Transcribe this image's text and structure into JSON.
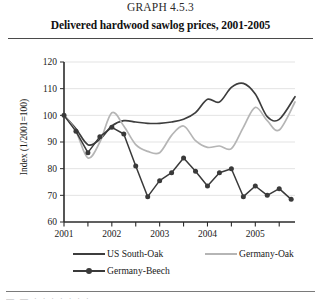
{
  "header": {
    "graph_number": "GRAPH 4.5.3",
    "title": "Delivered hardwood sawlog prices, 2001-2005"
  },
  "footer": {
    "clipped_text": "—  —   ·    ·     ·      · ·      · ·"
  },
  "colors": {
    "us_south_oak": "#3d3d3d",
    "germany_oak": "#b5b5b5",
    "germany_beech": "#3a3a3a",
    "grid": "#e3e3e3",
    "axis": "#2b2b2b",
    "text": "#1a1a1a"
  },
  "chart_data": {
    "type": "line",
    "title": "Delivered hardwood sawlog prices, 2001-2005",
    "subtitle": "GRAPH 4.5.3",
    "xlabel": "",
    "ylabel": "Index (1/2001=100)",
    "ylim": [
      60,
      120
    ],
    "yticks": [
      60,
      70,
      80,
      90,
      100,
      110,
      120
    ],
    "ytick_labels": [
      "60",
      "70",
      "80",
      "90",
      "100",
      "110",
      "120"
    ],
    "xlim": [
      2001.0,
      2005.83
    ],
    "xticks": [
      2001,
      2002,
      2003,
      2004,
      2005
    ],
    "xtick_labels": [
      "2001",
      "2002",
      "2003",
      "2004",
      "2005"
    ],
    "minor_xticks": [
      2001.5,
      2002.5,
      2003.5,
      2004.5,
      2005.5
    ],
    "grid": "horizontal",
    "legend_position": "below",
    "series": [
      {
        "name": "US South-Oak",
        "color": "#3d3d3d",
        "marker": "none",
        "x": [
          2001.0,
          2001.25,
          2001.5,
          2001.75,
          2002.0,
          2002.25,
          2002.5,
          2002.75,
          2003.0,
          2003.25,
          2003.5,
          2003.75,
          2004.0,
          2004.25,
          2004.5,
          2004.75,
          2005.0,
          2005.25,
          2005.5,
          2005.83
        ],
        "y": [
          100.0,
          95.0,
          89.0,
          91.0,
          96.0,
          98.0,
          97.5,
          97.0,
          97.0,
          97.5,
          98.5,
          101.0,
          106.0,
          105.0,
          110.5,
          112.0,
          108.0,
          99.5,
          98.5,
          107.0
        ]
      },
      {
        "name": "Germany-Oak",
        "color": "#b5b5b5",
        "marker": "none",
        "x": [
          2001.0,
          2001.25,
          2001.5,
          2001.75,
          2002.0,
          2002.25,
          2002.5,
          2002.75,
          2003.0,
          2003.25,
          2003.5,
          2003.75,
          2004.0,
          2004.25,
          2004.5,
          2004.75,
          2005.0,
          2005.25,
          2005.5,
          2005.83
        ],
        "y": [
          100.0,
          94.0,
          84.0,
          90.0,
          101.0,
          96.0,
          89.0,
          86.5,
          86.0,
          92.5,
          96.0,
          90.5,
          88.0,
          88.5,
          87.5,
          95.5,
          103.0,
          98.0,
          94.5,
          105.0
        ]
      },
      {
        "name": "Germany-Beech",
        "color": "#3a3a3a",
        "marker": "circle",
        "x": [
          2001.0,
          2001.25,
          2001.5,
          2001.75,
          2002.0,
          2002.25,
          2002.5,
          2002.75,
          2003.0,
          2003.25,
          2003.5,
          2003.75,
          2004.0,
          2004.25,
          2004.5,
          2004.75,
          2005.0,
          2005.25,
          2005.5,
          2005.75
        ],
        "y": [
          100.0,
          94.0,
          86.0,
          92.0,
          95.5,
          93.0,
          81.0,
          69.5,
          75.5,
          78.5,
          84.0,
          79.0,
          73.5,
          78.5,
          80.0,
          69.5,
          73.5,
          70.0,
          72.5,
          68.5
        ]
      }
    ]
  },
  "legend": {
    "entries": [
      {
        "label": "US South-Oak",
        "color": "#3d3d3d",
        "marker": false
      },
      {
        "label": "Germany-Oak",
        "color": "#b5b5b5",
        "marker": false
      },
      {
        "label": "Germany-Beech",
        "color": "#3a3a3a",
        "marker": true
      }
    ]
  }
}
